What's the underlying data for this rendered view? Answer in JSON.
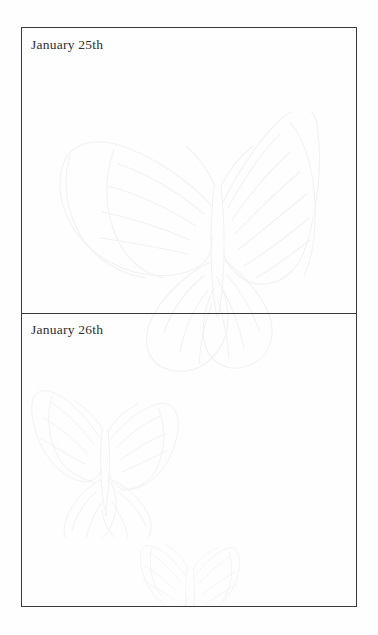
{
  "page": {
    "background_color": "#fefefe",
    "frame_border_color": "#3a3a3e",
    "text_color": "#2e2e33",
    "watermark_color": "#f1f1f4"
  },
  "journal": {
    "entries": [
      {
        "date_label": "January 25th",
        "body_text": ""
      },
      {
        "date_label": "January 26th",
        "body_text": ""
      }
    ]
  },
  "watermarks": [
    {
      "name": "butterfly-large",
      "panel": 0
    },
    {
      "name": "butterfly-medium",
      "panel": 1
    },
    {
      "name": "butterfly-small",
      "panel": 1
    }
  ]
}
